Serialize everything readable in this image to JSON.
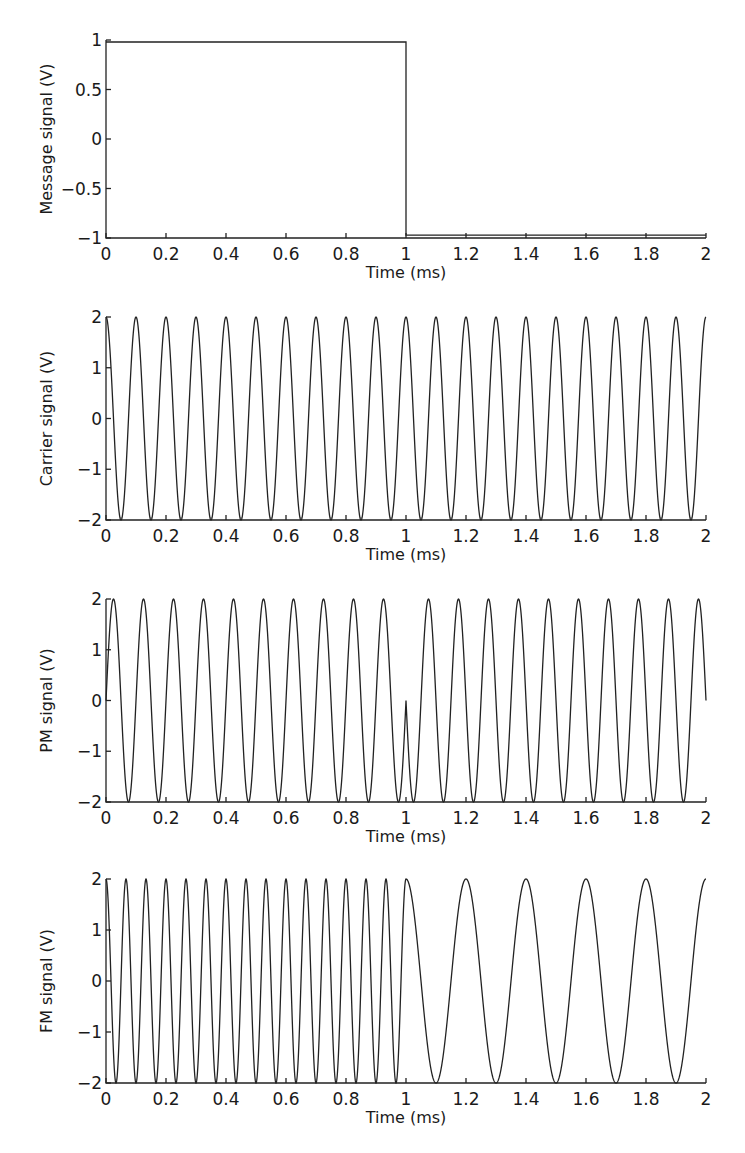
{
  "chart_data": [
    {
      "type": "line",
      "title": "",
      "xlabel": "Time (ms)",
      "ylabel": "Message signal (V)",
      "xlim": [
        0,
        2
      ],
      "ylim": [
        -1,
        1
      ],
      "xticks": [
        "0",
        "0.2",
        "0.4",
        "0.6",
        "0.8",
        "1",
        "1.2",
        "1.4",
        "1.6",
        "1.8",
        "2"
      ],
      "yticks": [
        "1",
        "0.5",
        "0",
        "−0.5",
        "−1"
      ],
      "ytick_values": [
        1,
        0.5,
        0,
        -0.5,
        -1
      ],
      "grid": false,
      "series": [
        {
          "name": "message",
          "kind": "square",
          "x": [
            0,
            1,
            1,
            2
          ],
          "values": [
            0.98,
            0.98,
            -0.97,
            -0.97
          ]
        }
      ],
      "pixel_box": {
        "left": 106,
        "right": 706,
        "top": 40,
        "bottom": 238
      }
    },
    {
      "type": "line",
      "title": "",
      "xlabel": "Time (ms)",
      "ylabel": "Carrier signal (V)",
      "xlim": [
        0,
        2
      ],
      "ylim": [
        -2,
        2
      ],
      "xticks": [
        "0",
        "0.2",
        "0.4",
        "0.6",
        "0.8",
        "1",
        "1.2",
        "1.4",
        "1.6",
        "1.8",
        "2"
      ],
      "yticks": [
        "2",
        "1",
        "0",
        "−1",
        "−2"
      ],
      "ytick_values": [
        2,
        1,
        0,
        -1,
        -2
      ],
      "grid": false,
      "series": [
        {
          "name": "carrier",
          "kind": "carrier",
          "amplitude": 2,
          "frequency_khz": 10,
          "description": "2cos(2π·10kHz·t)"
        }
      ],
      "pixel_box": {
        "left": 106,
        "right": 706,
        "top": 317,
        "bottom": 520
      }
    },
    {
      "type": "line",
      "title": "",
      "xlabel": "Time (ms)",
      "ylabel": "PM signal (V)",
      "xlim": [
        0,
        2
      ],
      "ylim": [
        -2,
        2
      ],
      "xticks": [
        "0",
        "0.2",
        "0.4",
        "0.6",
        "0.8",
        "1",
        "1.2",
        "1.4",
        "1.6",
        "1.8",
        "2"
      ],
      "yticks": [
        "2",
        "1",
        "0",
        "−1",
        "−2"
      ],
      "ytick_values": [
        2,
        1,
        0,
        -1,
        -2
      ],
      "grid": false,
      "series": [
        {
          "name": "pm",
          "kind": "pm",
          "amplitude": 2,
          "frequency_khz": 10,
          "description": "2sin(2π·10kHz·t) for t<1ms, −2sin(2π·10kHz·t) for t≥1ms (phase flip of π at 1 ms)"
        }
      ],
      "pixel_box": {
        "left": 106,
        "right": 706,
        "top": 599,
        "bottom": 802
      }
    },
    {
      "type": "line",
      "title": "",
      "xlabel": "Time (ms)",
      "ylabel": "FM signal (V)",
      "xlim": [
        0,
        2
      ],
      "ylim": [
        -2,
        2
      ],
      "xticks": [
        "0",
        "0.2",
        "0.4",
        "0.6",
        "0.8",
        "1",
        "1.2",
        "1.4",
        "1.6",
        "1.8",
        "2"
      ],
      "yticks": [
        "2",
        "1",
        "0",
        "−1",
        "−2"
      ],
      "ytick_values": [
        2,
        1,
        0,
        -1,
        -2
      ],
      "grid": false,
      "series": [
        {
          "name": "fm",
          "kind": "fm",
          "amplitude": 2,
          "frequency_khz_first_half": 15,
          "frequency_khz_second_half": 5,
          "description": "15 kHz for 0–1 ms, 5 kHz for 1–2 ms, continuous phase"
        }
      ],
      "pixel_box": {
        "left": 106,
        "right": 706,
        "top": 879,
        "bottom": 1083
      }
    }
  ]
}
